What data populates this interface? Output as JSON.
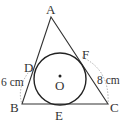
{
  "diagram": {
    "points": {
      "A": "A",
      "B": "B",
      "C": "C",
      "D": "D",
      "E": "E",
      "F": "F",
      "O": "O"
    },
    "measurements": {
      "BD": "6 cm",
      "CF": "8 cm"
    },
    "colors": {
      "stroke": "#333333",
      "dashed": "#888888"
    }
  }
}
